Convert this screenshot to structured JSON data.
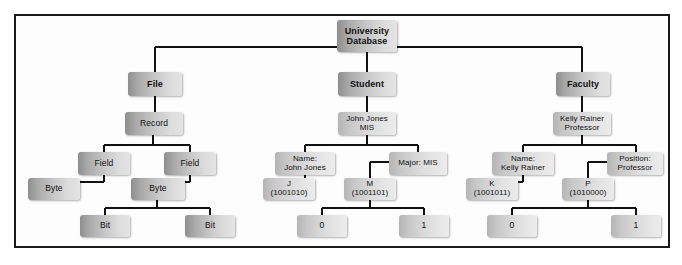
{
  "diagram": {
    "type": "tree-hierarchy",
    "border_color": "#1a1a1a",
    "background_color": "#fdfdfd",
    "node_fill_dark": "#8e8e8e",
    "node_fill_light": "#e4e4e4",
    "connector_color": "#111111"
  },
  "nodes": {
    "root": {
      "label": "University\nDatabase",
      "line1": "University",
      "line2": "Database"
    },
    "level2": [
      {
        "id": "file",
        "label": "File"
      },
      {
        "id": "student",
        "label": "Student"
      },
      {
        "id": "faculty",
        "label": "Faculty"
      }
    ],
    "file_branch": {
      "record": {
        "label": "Record"
      },
      "field_left": {
        "label": "Field"
      },
      "field_right": {
        "label": "Field"
      },
      "byte_left": {
        "label": "Byte"
      },
      "byte_right": {
        "label": "Byte"
      },
      "bit_left": {
        "label": "Bit"
      },
      "bit_right": {
        "label": "Bit"
      }
    },
    "student_branch": {
      "record": {
        "line1": "John Jones",
        "line2": "MIS"
      },
      "field_name": {
        "line1": "Name:",
        "line2": "John Jones"
      },
      "field_major": {
        "line1": "Major: MIS",
        "line2": ""
      },
      "byte_j": {
        "line1": "J",
        "line2": "(1001010)"
      },
      "byte_m": {
        "line1": "M",
        "line2": "(1001101)"
      },
      "bit_zero": {
        "label": "0"
      },
      "bit_one": {
        "label": "1"
      }
    },
    "faculty_branch": {
      "record": {
        "line1": "Kelly Rainer",
        "line2": "Professor"
      },
      "field_name": {
        "line1": "Name:",
        "line2": "Kelly Rainer"
      },
      "field_position": {
        "line1": "Position:",
        "line2": "Professor"
      },
      "byte_k": {
        "line1": "K",
        "line2": "(1001011)"
      },
      "byte_p": {
        "line1": "P",
        "line2": "(1010000)"
      },
      "bit_zero": {
        "label": "0"
      },
      "bit_one": {
        "label": "1"
      }
    }
  }
}
